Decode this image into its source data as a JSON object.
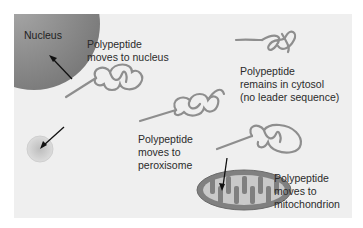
{
  "diagram": {
    "colors": {
      "background": "#efefef",
      "nucleus": "#8c8c8c",
      "polypeptide": "#9a9a9a",
      "peroxisome": "#c8c8c8",
      "mitochondrion": "#7f7f7f",
      "arrow": "#111111",
      "text": "#2b2b2b"
    },
    "structures": {
      "nucleus": "Nucleus"
    },
    "labels": {
      "nucleus": {
        "line1": "Polypeptide",
        "line2": "moves to nucleus"
      },
      "cytosol": {
        "line1": "Polypeptide",
        "line2": "remains in cytosol",
        "line3": "(no leader sequence)"
      },
      "peroxisome": {
        "line1": "Polypeptide",
        "line2": "moves to",
        "line3": "peroxisome"
      },
      "mitochondrion": {
        "line1": "Polypeptide",
        "line2": "moves to",
        "line3": "mitochondrion"
      }
    }
  }
}
